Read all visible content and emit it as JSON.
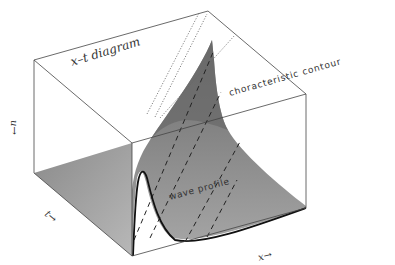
{
  "diagram": {
    "labels": {
      "title": "x–t diagram",
      "characteristic": "choracteristic contour",
      "wave_profile": "wave profile",
      "axis_x": "x→",
      "axis_t": "t→",
      "axis_u": "u→"
    },
    "colors": {
      "surface_dark": "#6e6e6e",
      "surface_mid": "#9a9a9a",
      "surface_light": "#b4b4b4",
      "floor": "#a0a0a0",
      "box_line": "#333333",
      "profile_line": "#111111",
      "dashed_line": "#222222",
      "dotted_line": "#666666"
    }
  }
}
